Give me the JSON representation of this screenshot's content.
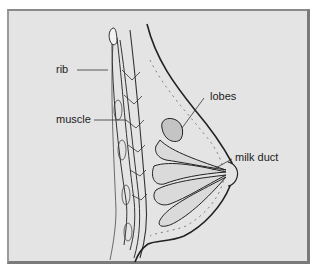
{
  "diagram": {
    "colors": {
      "background": "#e4e4e4",
      "frame_border": "#7a7a7a",
      "line": "#2a2a2a",
      "label_text": "#222222"
    },
    "labels": {
      "rib": "rib",
      "muscle": "muscle",
      "lobes": "lobes",
      "milk_duct": "milk duct"
    }
  }
}
